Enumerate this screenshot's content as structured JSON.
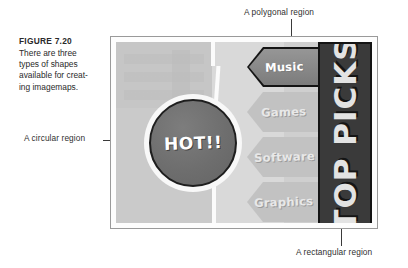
{
  "figure": {
    "title": "FIGURE 7.20",
    "caption_lines": [
      "There are three",
      "types of shapes",
      "available for creat-",
      "ing imagemaps."
    ]
  },
  "annotations": {
    "polygonal": "A polygonal region",
    "circular": "A circular region",
    "rectangular": "A rectangular region"
  },
  "imagemap": {
    "circle_region": {
      "label": "HOT!!",
      "shape": "circle"
    },
    "polygon_regions": [
      {
        "label": "Music",
        "shape": "polygon",
        "selected": true
      },
      {
        "label": "Games",
        "shape": "polygon",
        "selected": false
      },
      {
        "label": "Software",
        "shape": "polygon",
        "selected": false
      },
      {
        "label": "Graphics",
        "shape": "polygon",
        "selected": false
      }
    ],
    "rect_region": {
      "label": "TOP PICKS",
      "shape": "rect"
    }
  },
  "colors": {
    "banner_bg": "#3a3a3a",
    "banner_border": "#141414",
    "circle_fill": "#6e6e6e",
    "circle_border": "#1e1e1e",
    "chevron_selected": "#8d8d8d",
    "chevron_default": "#c2c2c2",
    "panel_bg": "#cfcfcf",
    "panel_border": "#9a9a9a",
    "text_dark": "#2a2a2a",
    "leader_line": "#3a3a3a"
  }
}
